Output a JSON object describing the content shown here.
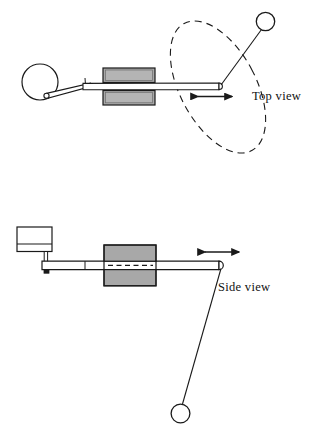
{
  "figure": {
    "background_color": "#ffffff",
    "line_color": "#1a1a1a",
    "fill_gray": "#a8a8a8",
    "fill_light_gray": "#c9c9c9",
    "width": 319,
    "height": 436
  },
  "views": [
    {
      "id": "top",
      "label": "Top view",
      "label_x": 252,
      "label_y": 100,
      "components": {
        "crank_disc": {
          "name": "crank-disc",
          "cx": 40,
          "cy": 82,
          "r": 18
        },
        "crank_pin": {
          "name": "crank-pin",
          "cx": 46,
          "cy": 96,
          "r": 2.6
        },
        "connecting_rod": {
          "name": "connecting-rod",
          "x1": 46,
          "y1": 96,
          "x2": 89,
          "y2": 86
        },
        "slider_block": {
          "name": "slider-block",
          "x": 103,
          "y": 68,
          "width": 52,
          "height": 32
        },
        "main_rod": {
          "name": "main-rod",
          "x1": 83,
          "y1": 87,
          "x2": 222,
          "y2": 86
        },
        "motion_arrow": {
          "name": "motion-arrow",
          "x1": 196,
          "x2": 234,
          "y": 96,
          "double_headed": true
        },
        "pendulum_ball": {
          "name": "pendulum-ball",
          "cx": 265,
          "cy": 21,
          "r": 9
        },
        "pendulum_string": {
          "name": "pendulum-string",
          "x1": 222,
          "y1": 86,
          "x2": 262,
          "y2": 30
        },
        "swing_path": {
          "name": "swing-path-ellipse",
          "cx": 218,
          "cy": 87,
          "rx": 38,
          "ry": 72,
          "rotation_deg": -28,
          "dashed": true
        }
      }
    },
    {
      "id": "side",
      "label": "Side view",
      "label_x": 218,
      "label_y": 291,
      "components": {
        "motor_box": {
          "name": "motor-box",
          "x": 17,
          "y": 227,
          "width": 35,
          "height": 24,
          "divider_y": 244
        },
        "motor_shaft": {
          "name": "motor-shaft",
          "x": 46,
          "y1": 251,
          "y2": 266
        },
        "rod_pivot_pin": {
          "name": "rod-pivot-pin",
          "cx": 46,
          "cy": 271,
          "size": 4
        },
        "slider_block": {
          "name": "slider-block",
          "x": 104,
          "y": 245,
          "width": 52,
          "height": 40
        },
        "main_rod": {
          "name": "main-rod",
          "x1": 43,
          "y1": 265,
          "x2": 222,
          "y2": 265
        },
        "center_line": {
          "name": "rod-center-line",
          "dashed": true,
          "x1": 110,
          "x2": 152,
          "y": 265
        },
        "motion_arrow": {
          "name": "motion-arrow",
          "x1": 203,
          "x2": 241,
          "y": 252,
          "double_headed": true
        },
        "pendulum_string": {
          "name": "pendulum-string",
          "x1": 222,
          "y1": 267,
          "x2": 182,
          "y2": 404
        },
        "pendulum_ball": {
          "name": "pendulum-ball",
          "cx": 180,
          "cy": 414,
          "r": 9
        }
      }
    }
  ]
}
